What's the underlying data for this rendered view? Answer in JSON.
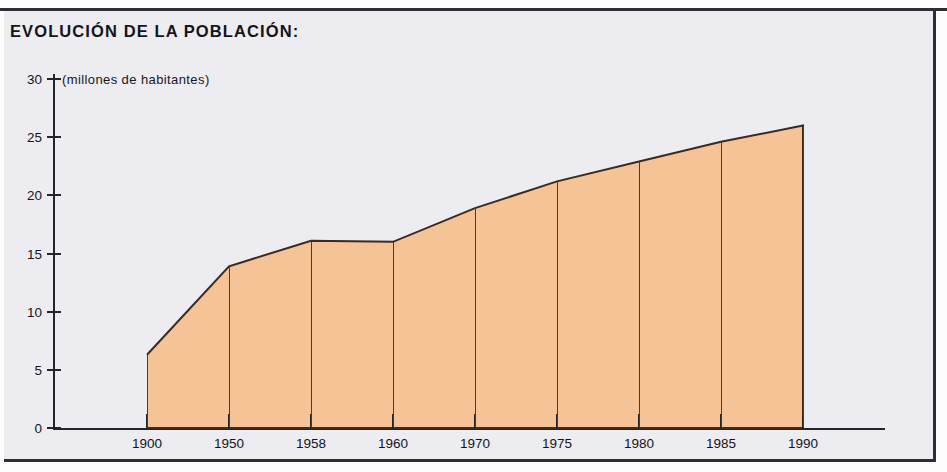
{
  "title": "EVOLUCIÓN DE LA POBLACIÓN:",
  "subtitle": "(millones de habitantes)",
  "colors": {
    "area_fill": "#f5c396",
    "area_stroke": "#3a2a20",
    "axis": "#24242b",
    "panel_background": "#ececf1",
    "text": "#14141a",
    "frame": "#2d2d33"
  },
  "chart_data": {
    "type": "area",
    "title": "EVOLUCIÓN DE LA POBLACIÓN:",
    "subtitle": "(millones de habitantes)",
    "xlabel": "",
    "ylabel": "millones de habitantes",
    "categories": [
      "1900",
      "1950",
      "1958",
      "1960",
      "1970",
      "1975",
      "1980",
      "1985",
      "1990"
    ],
    "values": [
      6.3,
      13.9,
      16.1,
      16.0,
      18.9,
      21.2,
      22.9,
      24.6,
      26.0
    ],
    "ylim": [
      0,
      30
    ],
    "yticks": [
      0,
      5,
      10,
      15,
      20,
      25,
      30
    ],
    "ytick_labels": [
      "0",
      "5",
      "10",
      "15",
      "20",
      "25",
      "30"
    ],
    "xtick_labels": [
      "1900",
      "1950",
      "1958",
      "1960",
      "1970",
      "1975",
      "1980",
      "1985",
      "1990"
    ],
    "grid": false,
    "legend": null,
    "series": [
      {
        "name": "Población",
        "values": [
          6.3,
          13.9,
          16.1,
          16.0,
          18.9,
          21.2,
          22.9,
          24.6,
          26.0
        ]
      }
    ],
    "annotations": []
  }
}
